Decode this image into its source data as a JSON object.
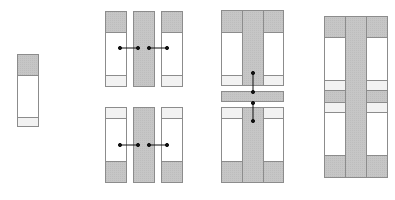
{
  "diagram": {
    "colors": {
      "background": "#ffffff",
      "panel_fill": "#ffffff",
      "shaded_fill": "#c8c8c8",
      "light_band": "#f2f2f2",
      "stroke": "#8c8c8c",
      "connector": "#111111"
    },
    "steps": [
      {
        "id": "step-1",
        "label": "single panel"
      },
      {
        "id": "step-2",
        "label": "two rows of three panels with horizontal connectors"
      },
      {
        "id": "step-3",
        "label": "panels joined with center crossbar and vertical connectors"
      },
      {
        "id": "step-4",
        "label": "assembled cross-shaped frame"
      }
    ]
  }
}
